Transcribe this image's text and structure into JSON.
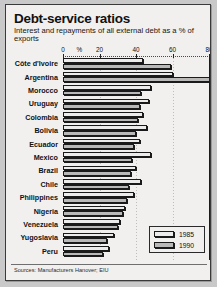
{
  "header": {
    "title": "Debt-service ratios",
    "subtitle": "Interest and repayments of all external debt as a % of exports"
  },
  "source": "Sources: Manufacturers Hanover; EIU",
  "legend": {
    "items": [
      {
        "label": "1985",
        "color": "#ececec"
      },
      {
        "label": "1990",
        "color": "#b9b9b9"
      }
    ]
  },
  "axis": {
    "percent_symbol": "%",
    "ticks": [
      0,
      20,
      40,
      60,
      80
    ]
  },
  "chart_data": {
    "type": "bar",
    "orientation": "horizontal",
    "title": "Debt-service ratios",
    "subtitle": "Interest and repayments of all external debt as a % of exports",
    "xlabel": "%",
    "ylabel": "",
    "xlim": [
      0,
      80
    ],
    "xticks": [
      0,
      20,
      40,
      60,
      80
    ],
    "grid": true,
    "legend_position": "bottom-right",
    "source": "Sources: Manufacturers Hanover; EIU",
    "categories": [
      "Côte d'Ivoire",
      "Argentina",
      "Morocco",
      "Uruguay",
      "Colombia",
      "Bolivia",
      "Ecuador",
      "Mexico",
      "Brazil",
      "Chile",
      "Philippines",
      "Nigeria",
      "Venezuela",
      "Yugoslavia",
      "Peru"
    ],
    "series": [
      {
        "name": "1985",
        "color": "#ececec",
        "values": [
          44,
          60,
          48,
          47,
          44,
          46,
          42,
          48,
          40,
          43,
          39,
          34,
          31,
          28,
          25
        ]
      },
      {
        "name": "1990",
        "color": "#b9b9b9",
        "values": [
          59,
          81,
          43,
          42,
          41,
          40,
          39,
          38,
          37,
          36,
          35,
          33,
          30,
          24,
          22
        ]
      }
    ]
  }
}
